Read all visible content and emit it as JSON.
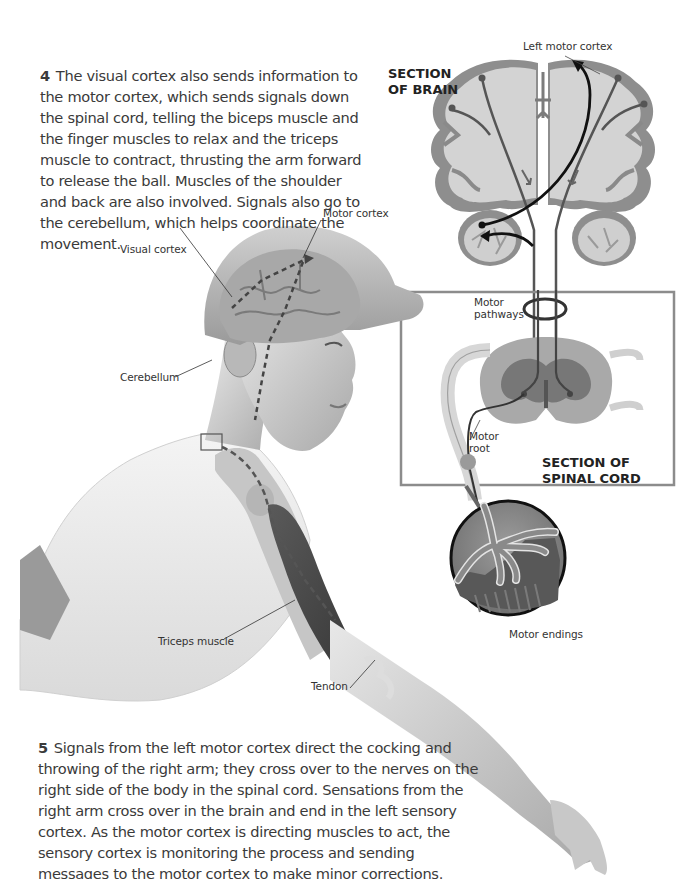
{
  "captions": {
    "step4": {
      "number": "4",
      "text": "The visual cortex also sends information to the motor cortex, which sends signals down the spinal cord, telling the biceps muscle and the finger muscles to relax and the triceps muscle to contract, thrusting the arm forward to release the ball. Muscles of the shoulder and back are also involved. Signals also go to the cerebellum, which helps coordinate the movement."
    },
    "step5": {
      "number": "5",
      "text": "Signals from the left motor cortex direct the cocking and throwing of the right arm; they cross over to the nerves on the right side of the body in the spinal cord. Sensations from the right arm cross over in the brain and end in the left sensory cortex. As the motor cortex is directing muscles to act, the sensory cortex is monitoring the process and sending messages to the motor cortex to make minor corrections."
    }
  },
  "section_titles": {
    "brain": {
      "line1": "SECTION",
      "line2": "OF BRAIN"
    },
    "spinal_cord": {
      "line1": "SECTION OF",
      "line2": "SPINAL CORD"
    }
  },
  "labels": {
    "left_motor_cortex": "Left motor cortex",
    "motor_cortex": "Motor cortex",
    "visual_cortex": "Visual cortex",
    "cerebellum": "Cerebellum",
    "motor_pathways_1": "Motor",
    "motor_pathways_2": "pathways",
    "motor_root_1": "Motor",
    "motor_root_2": "root",
    "motor_endings": "Motor endings",
    "triceps_muscle": "Triceps muscle",
    "tendon": "Tendon"
  },
  "colors": {
    "background": "#ffffff",
    "text": "#3a3a3a",
    "brain_fill": "#cfcfcf",
    "cortex_gray": "#8a8a8a",
    "pathway_dark": "#4a4a4a",
    "arrow_black": "#111111",
    "box_border": "#8c8c8c"
  }
}
